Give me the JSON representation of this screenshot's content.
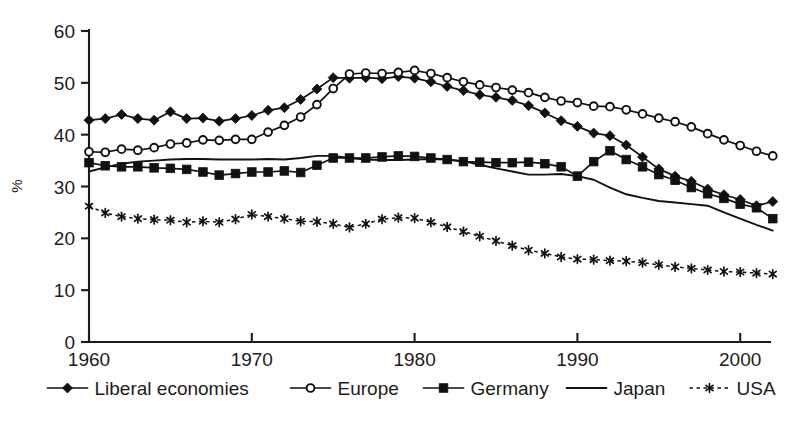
{
  "chart_data": {
    "type": "line",
    "title": "",
    "xlabel": "",
    "ylabel": "%",
    "xlim": [
      1960,
      2002
    ],
    "ylim": [
      0,
      60
    ],
    "ytick_values": [
      0,
      10,
      20,
      30,
      40,
      50,
      60
    ],
    "ytick_labels": [
      "0",
      "10",
      "20",
      "30",
      "40",
      "50",
      "60"
    ],
    "xtick_values": [
      1960,
      1970,
      1980,
      1990,
      2000
    ],
    "xtick_labels": [
      "1960",
      "1970",
      "1980",
      "1990",
      "2000"
    ],
    "grid": false,
    "legend_position": "bottom",
    "x": [
      1960,
      1961,
      1962,
      1963,
      1964,
      1965,
      1966,
      1967,
      1968,
      1969,
      1970,
      1971,
      1972,
      1973,
      1974,
      1975,
      1976,
      1977,
      1978,
      1979,
      1980,
      1981,
      1982,
      1983,
      1984,
      1985,
      1986,
      1987,
      1988,
      1989,
      1990,
      1991,
      1992,
      1993,
      1994,
      1995,
      1996,
      1997,
      1998,
      1999,
      2000,
      2001,
      2002
    ],
    "series": [
      {
        "name": "Liberal economies",
        "marker": "filled-diamond",
        "line_style": "solid",
        "color": "#111111",
        "values": [
          42.8,
          43.1,
          43.9,
          43.1,
          42.8,
          44.4,
          43.1,
          43.2,
          42.6,
          43.1,
          43.7,
          44.7,
          45.2,
          46.8,
          48.8,
          51.0,
          50.9,
          51.0,
          50.8,
          51.2,
          50.9,
          50.2,
          49.3,
          48.5,
          47.7,
          47.2,
          46.6,
          45.6,
          44.2,
          42.7,
          41.6,
          40.3,
          39.8,
          38.0,
          35.7,
          33.4,
          32.0,
          31.0,
          29.5,
          28.4,
          27.5,
          26.3,
          27.1
        ]
      },
      {
        "name": "Europe",
        "marker": "open-circle",
        "line_style": "solid",
        "color": "#111111",
        "values": [
          36.7,
          36.6,
          37.2,
          37.0,
          37.5,
          38.2,
          38.4,
          39.0,
          38.9,
          39.1,
          39.1,
          40.5,
          41.8,
          43.4,
          45.8,
          48.9,
          51.7,
          51.9,
          51.8,
          52.0,
          52.4,
          51.8,
          51.0,
          50.2,
          49.6,
          49.1,
          48.6,
          48.1,
          47.2,
          46.5,
          46.2,
          45.5,
          45.4,
          44.8,
          44.0,
          43.2,
          42.5,
          41.5,
          40.2,
          39.0,
          37.9,
          36.8,
          35.9
        ]
      },
      {
        "name": "Germany",
        "marker": "filled-square",
        "line_style": "solid",
        "color": "#111111",
        "values": [
          34.6,
          34.0,
          33.8,
          33.8,
          33.6,
          33.5,
          33.3,
          32.8,
          32.2,
          32.5,
          32.8,
          32.8,
          33.0,
          32.7,
          34.1,
          35.5,
          35.5,
          35.5,
          35.7,
          35.9,
          35.8,
          35.5,
          35.2,
          34.8,
          34.7,
          34.6,
          34.6,
          34.7,
          34.4,
          33.8,
          32.0,
          34.8,
          36.9,
          35.2,
          33.8,
          32.3,
          31.2,
          29.8,
          28.6,
          27.7,
          26.6,
          25.9,
          23.8
        ]
      },
      {
        "name": "Japan",
        "marker": "none",
        "line_style": "solid",
        "color": "#111111",
        "values": [
          32.9,
          33.7,
          34.4,
          34.8,
          35.0,
          35.2,
          35.3,
          35.3,
          35.2,
          35.2,
          35.2,
          35.3,
          35.2,
          35.5,
          35.9,
          35.9,
          35.5,
          35.2,
          35.1,
          35.1,
          35.2,
          35.3,
          35.2,
          34.9,
          34.2,
          33.5,
          32.9,
          32.3,
          32.3,
          32.4,
          32.0,
          31.3,
          29.8,
          28.5,
          27.8,
          27.2,
          26.9,
          26.6,
          26.3,
          25.0,
          23.8,
          22.6,
          21.5
        ]
      },
      {
        "name": "USA",
        "marker": "star",
        "line_style": "dashed",
        "color": "#111111",
        "values": [
          26.2,
          24.9,
          24.2,
          23.8,
          23.6,
          23.5,
          23.1,
          23.3,
          23.1,
          23.7,
          24.6,
          24.2,
          23.8,
          23.3,
          23.2,
          22.8,
          22.1,
          22.8,
          23.7,
          24.0,
          23.9,
          23.1,
          22.2,
          21.3,
          20.4,
          19.5,
          18.6,
          17.7,
          17.1,
          16.4,
          16.0,
          15.9,
          15.7,
          15.6,
          15.3,
          14.9,
          14.5,
          14.2,
          13.9,
          13.6,
          13.5,
          13.3,
          13.1
        ]
      }
    ]
  },
  "legend": {
    "items": [
      {
        "label": "Liberal economies",
        "marker": "filled-diamond",
        "style": "solid"
      },
      {
        "label": "Europe",
        "marker": "open-circle",
        "style": "solid"
      },
      {
        "label": "Germany",
        "marker": "filled-square",
        "style": "solid"
      },
      {
        "label": "Japan",
        "marker": "none",
        "style": "solid"
      },
      {
        "label": "USA",
        "marker": "star",
        "style": "dashed"
      }
    ]
  }
}
